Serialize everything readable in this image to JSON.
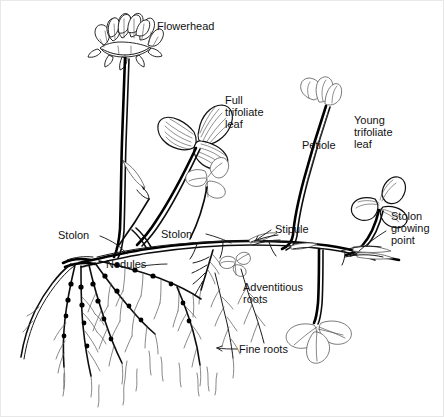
{
  "figure": {
    "background_color": "#ffffff",
    "ink_color": "#000000",
    "label_color": "#111111"
  },
  "labels": {
    "flowerhead": "Flowerhead",
    "full_trifoliate_leaf_line1": "Full",
    "full_trifoliate_leaf_line2": "trifoliate",
    "full_trifoliate_leaf_line3": "leaf",
    "petiole": "Petiole",
    "young_trifoliate_leaf_line1": "Young",
    "young_trifoliate_leaf_line2": "trifoliate",
    "young_trifoliate_leaf_line3": "leaf",
    "stolon_growing_point_line1": "Stolon",
    "stolon_growing_point_line2": "growing",
    "stolon_growing_point_line3": "point",
    "stipule": "Stipule",
    "stolon_left": "Stolon",
    "stolon_middle": "Stolon",
    "nodules": "Nodules",
    "adventitious_roots_line1": "Adventitious",
    "adventitious_roots_line2": "roots",
    "fine_roots": "Fine roots"
  },
  "parts": [
    {
      "name": "flowerhead",
      "label": "Flowerhead"
    },
    {
      "name": "full-trifoliate-leaf",
      "label": "Full trifoliate leaf"
    },
    {
      "name": "petiole",
      "label": "Petiole"
    },
    {
      "name": "young-trifoliate-leaf",
      "label": "Young trifoliate leaf"
    },
    {
      "name": "stolon-growing-point",
      "label": "Stolon growing point"
    },
    {
      "name": "stipule",
      "label": "Stipule"
    },
    {
      "name": "stolon",
      "label": "Stolon"
    },
    {
      "name": "nodules",
      "label": "Nodules"
    },
    {
      "name": "adventitious-roots",
      "label": "Adventitious roots"
    },
    {
      "name": "fine-roots",
      "label": "Fine roots"
    }
  ]
}
